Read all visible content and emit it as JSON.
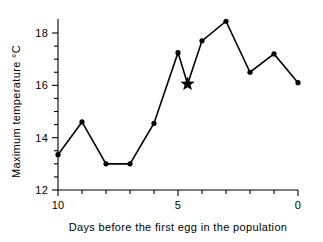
{
  "chart_data": {
    "type": "line",
    "title": "",
    "xlabel": "Days before the first egg in the population",
    "ylabel": "Maximum temperature °C",
    "xlim": [
      10,
      0
    ],
    "ylim": [
      12,
      18.6
    ],
    "x_axis_reversed": true,
    "grid": false,
    "legend": null,
    "x_tick_labels": [
      "10",
      "5",
      "0"
    ],
    "x_tick_label_values": [
      10,
      5,
      0
    ],
    "x_minor_ticks": [
      10,
      9,
      8,
      7,
      6,
      5,
      4,
      3,
      2,
      1,
      0
    ],
    "y_tick_labels": [
      "12",
      "14",
      "16",
      "18"
    ],
    "y_tick_label_values": [
      12,
      14,
      16,
      18
    ],
    "y_minor_ticks": [
      12,
      12.5,
      13,
      13.5,
      14,
      14.5,
      15,
      15.5,
      16,
      16.5,
      17,
      17.5,
      18
    ],
    "x": [
      10,
      9,
      8,
      7,
      6,
      4.6,
      5,
      4,
      3,
      2,
      1,
      0
    ],
    "values": [
      13.35,
      14.6,
      13.0,
      13.0,
      14.55,
      16.05,
      17.25,
      17.7,
      18.45,
      16.5,
      17.2,
      16.1
    ],
    "series": [
      {
        "name": "Maximum temperature",
        "points": [
          {
            "x": 10,
            "y": 13.35,
            "marker": "circle"
          },
          {
            "x": 9,
            "y": 14.6,
            "marker": "circle"
          },
          {
            "x": 8,
            "y": 13.0,
            "marker": "circle"
          },
          {
            "x": 7,
            "y": 13.0,
            "marker": "circle"
          },
          {
            "x": 6,
            "y": 14.55,
            "marker": "circle"
          },
          {
            "x": 4.6,
            "y": 16.05,
            "marker": "star"
          },
          {
            "x": 5,
            "y": 17.25,
            "marker": "circle"
          },
          {
            "x": 4,
            "y": 17.7,
            "marker": "circle"
          },
          {
            "x": 3,
            "y": 18.45,
            "marker": "circle"
          },
          {
            "x": 2,
            "y": 16.5,
            "marker": "circle"
          },
          {
            "x": 1,
            "y": 17.2,
            "marker": "circle"
          },
          {
            "x": 0,
            "y": 16.1,
            "marker": "circle"
          }
        ]
      }
    ],
    "annotations": [
      {
        "name": "star-highlight",
        "x": 4.6,
        "y": 16.05,
        "marker": "star",
        "note": "highlighted data point"
      }
    ],
    "colors": {
      "line": "#000000",
      "marker": "#000000",
      "axis": "#000000",
      "background": "#ffffff"
    }
  }
}
